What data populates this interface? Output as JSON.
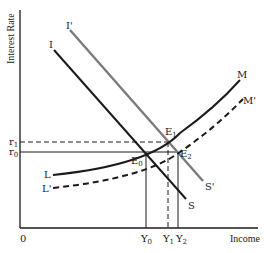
{
  "diagram": {
    "type": "IS-LM shift diagram",
    "axes": {
      "y_label": "Interest Rate",
      "x_label": "Income",
      "origin_label": "0"
    },
    "rate_levels": [
      {
        "id": "r1",
        "base": "r",
        "sub": "1",
        "style": "dashed"
      },
      {
        "id": "r0",
        "base": "r",
        "sub": "0",
        "style": "solid"
      }
    ],
    "income_levels": [
      {
        "id": "Y0",
        "base": "Y",
        "sub": "0",
        "style": "solid"
      },
      {
        "id": "Y1",
        "base": "Y",
        "sub": "1",
        "style": "dashed"
      },
      {
        "id": "Y2",
        "base": "Y",
        "sub": "2",
        "style": "solid"
      }
    ],
    "curves": [
      {
        "id": "IS",
        "start_label": "I",
        "end_label": "S",
        "color": "#1a1a1a",
        "style": "solid"
      },
      {
        "id": "IS_prime",
        "start_label": "I'",
        "end_label": "S'",
        "color": "#7a7a7a",
        "style": "solid"
      },
      {
        "id": "LM",
        "start_label": "L",
        "end_label": "M",
        "color": "#1a1a1a",
        "style": "solid"
      },
      {
        "id": "LM_prime",
        "start_label": "L'",
        "end_label": "M'",
        "color": "#1a1a1a",
        "style": "dashed"
      }
    ],
    "equilibria": [
      {
        "id": "E0",
        "base": "E",
        "sub": "0"
      },
      {
        "id": "E1",
        "base": "E",
        "sub": "1"
      },
      {
        "id": "E2",
        "base": "E",
        "sub": "2"
      }
    ]
  }
}
